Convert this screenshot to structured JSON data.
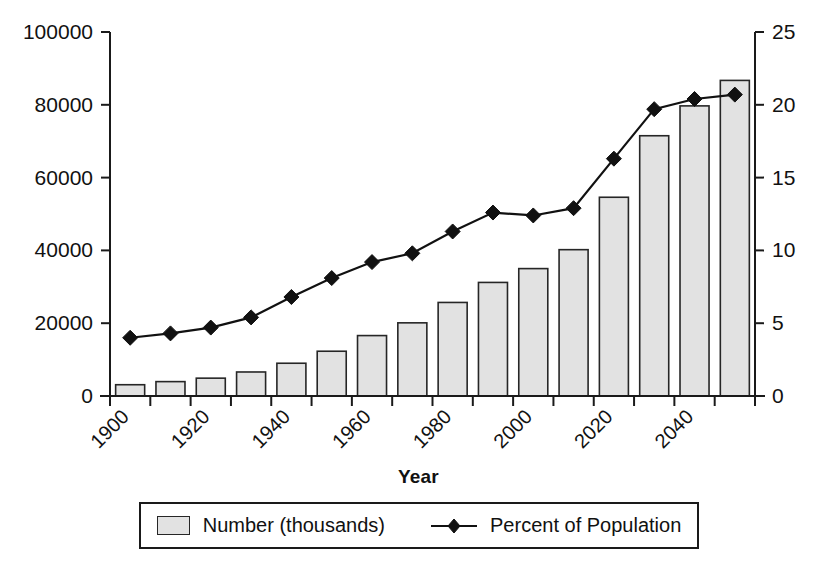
{
  "chart_data": {
    "type": "bar",
    "title": "",
    "subtitle": "",
    "xlabel": "Year",
    "ylabel": "",
    "categories": [
      1900,
      1910,
      1920,
      1930,
      1940,
      1950,
      1960,
      1970,
      1980,
      1990,
      2000,
      2010,
      2020,
      2030,
      2040,
      2050
    ],
    "x_tick_labels": [
      "1900",
      "",
      "1920",
      "",
      "1940",
      "",
      "1960",
      "",
      "1980",
      "",
      "2000",
      "",
      "2020",
      "",
      "2040",
      ""
    ],
    "x_tick_labels_shown": [
      "1900",
      "1920",
      "1940",
      "1960",
      "1980",
      "2000",
      "2020",
      "2040"
    ],
    "x_tick_rotation_deg": 45,
    "grid": false,
    "legend_position": "bottom",
    "left_axis": {
      "label": "",
      "ylim": [
        0,
        100000
      ],
      "ticks": [
        0,
        20000,
        40000,
        60000,
        80000,
        100000
      ],
      "tick_labels": [
        "0",
        "20000",
        "40000",
        "60000",
        "80000",
        "100000"
      ]
    },
    "right_axis": {
      "label": "",
      "ylim": [
        0,
        25
      ],
      "ticks": [
        0,
        5,
        10,
        15,
        20,
        25
      ],
      "tick_labels": [
        "0",
        "5",
        "10",
        "15",
        "20",
        "25"
      ]
    },
    "series": [
      {
        "name": "Number (thousands)",
        "type": "bar",
        "axis": "left",
        "fill_color": "#e2e2e2",
        "edge_color": "#262626",
        "values": [
          3100,
          3950,
          4900,
          6600,
          9000,
          12300,
          16600,
          20100,
          25700,
          31200,
          35000,
          40200,
          54600,
          71500,
          79700,
          86700
        ]
      },
      {
        "name": "Percent of Population",
        "type": "line",
        "axis": "right",
        "marker": "diamond",
        "line_color": "#111111",
        "values": [
          4.0,
          4.3,
          4.7,
          5.4,
          6.8,
          8.1,
          9.2,
          9.8,
          11.3,
          12.6,
          12.4,
          12.9,
          16.3,
          19.7,
          20.4,
          20.7
        ]
      }
    ],
    "annotations": []
  },
  "legend": {
    "entries": [
      {
        "label": "Number (thousands)",
        "marker": "square-swatch"
      },
      {
        "label": "Percent of Population",
        "marker": "line-diamond"
      }
    ]
  },
  "axis_title": {
    "text": "Year"
  },
  "colors": {
    "bar_fill": "#e2e2e2",
    "bar_edge": "#262626",
    "line": "#111111",
    "axis": "#1a1a1a",
    "background": "#ffffff"
  }
}
